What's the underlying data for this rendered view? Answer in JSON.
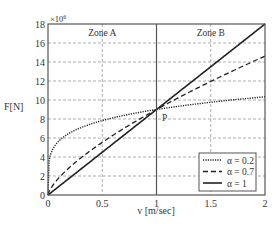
{
  "chart_data": {
    "type": "line",
    "title": "",
    "xlabel": "v [m/sec]",
    "ylabel": "F[N]",
    "y_multiplier": "×10",
    "y_multiplier_exp": "6",
    "xlim": [
      0,
      2
    ],
    "ylim": [
      0,
      18
    ],
    "x_ticks": [
      0,
      0.5,
      1,
      1.5,
      2
    ],
    "x_tick_labels": [
      "0",
      "0.5",
      "1",
      "1.5",
      "2"
    ],
    "y_ticks": [
      0,
      2,
      4,
      6,
      8,
      10,
      12,
      14,
      16,
      18
    ],
    "y_tick_labels": [
      "0",
      "2",
      "4",
      "6",
      "8",
      "10",
      "12",
      "14",
      "16",
      "18"
    ],
    "grid": true,
    "legend_position": "lower right",
    "formula": "F = 9e6 * v^alpha",
    "series": [
      {
        "name": "α = 0.2",
        "alpha": 0.2,
        "style": "dotted",
        "x": [
          0,
          0.25,
          0.5,
          0.75,
          1,
          1.25,
          1.5,
          1.75,
          2
        ],
        "values": [
          0,
          6.82,
          7.84,
          8.48,
          9.0,
          9.41,
          9.76,
          10.07,
          10.34
        ]
      },
      {
        "name": "α = 0.7",
        "alpha": 0.7,
        "style": "dashed",
        "x": [
          0,
          0.25,
          0.5,
          0.75,
          1,
          1.25,
          1.5,
          1.75,
          2
        ],
        "values": [
          0,
          3.42,
          5.54,
          7.36,
          9.0,
          10.52,
          11.95,
          13.31,
          14.62
        ]
      },
      {
        "name": "α = 1",
        "alpha": 1,
        "style": "solid",
        "x": [
          0,
          0.5,
          1,
          1.5,
          2
        ],
        "values": [
          0,
          4.5,
          9.0,
          13.5,
          18.0
        ]
      }
    ],
    "annotations": [
      {
        "text": "Zone A",
        "x": 0.5,
        "y": 17.2
      },
      {
        "text": "Zone B",
        "x": 1.5,
        "y": 17.2
      },
      {
        "text": "P",
        "x": 1.05,
        "y": 8.2
      }
    ],
    "vertical_divider_x": 1
  }
}
